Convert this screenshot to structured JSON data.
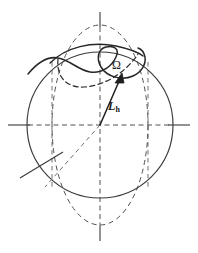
{
  "figure": {
    "domain": "Diagram",
    "background_color": "#ffffff",
    "stroke_color": "#3a3a3a",
    "label_color": "#1a1a1a",
    "width": 198,
    "height": 253,
    "labels": {
      "omega": "Ω",
      "angular_momentum_symbol": "L",
      "angular_momentum_subscript": "h"
    },
    "elements": {
      "solid_circle": {
        "name": "solid-circle",
        "center_x": 100,
        "center_y": 125,
        "radius": 73,
        "style": "solid"
      },
      "dashed_ellipse": {
        "name": "dashed-ellipse",
        "center_x": 100,
        "center_y": 125,
        "rx": 48,
        "ry": 100,
        "style": "dashed"
      },
      "vertical_axis": {
        "name": "vertical-axis",
        "x": 100,
        "y_top": 12,
        "y_bottom": 241,
        "style": "dashed-with-solid-ends"
      },
      "horizontal_axis": {
        "name": "horizontal-axis",
        "y": 125,
        "x_left": 8,
        "x_right": 190,
        "style": "dashed-with-solid-ends"
      },
      "dashed_vertical_left": {
        "name": "dashed-vertical-left",
        "x": 52,
        "style": "dashed"
      },
      "dashed_vertical_right": {
        "name": "dashed-vertical-right",
        "x": 148,
        "style": "dashed"
      },
      "omega_arrow": {
        "name": "omega-arrow",
        "from_x": 100,
        "from_y": 125,
        "to_x": 122,
        "to_y": 75,
        "style": "solid-with-arrowhead"
      },
      "solid_orbit_curve": {
        "name": "solid-orbit-curve",
        "description": "S-shaped precession loop, upper solid arc",
        "style": "solid"
      },
      "dashed_orbit_curve": {
        "name": "dashed-orbit-curve",
        "description": "hidden half of precession loop behind sphere",
        "style": "dashed"
      },
      "node_line_solid": {
        "name": "node-line-solid",
        "from_x": 21,
        "from_y": 177,
        "to_x": 62,
        "to_y": 153,
        "style": "solid"
      },
      "node_line_dashed": {
        "name": "node-line-dashed",
        "from_x": 100,
        "from_y": 125,
        "to_x": 44,
        "to_y": 188,
        "style": "dashed"
      }
    }
  }
}
